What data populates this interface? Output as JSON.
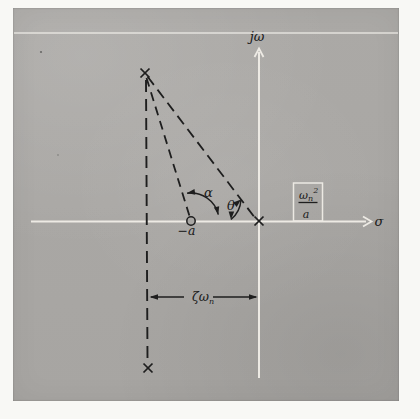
{
  "figure": {
    "kind": "s-plane pole-zero diagram (scanned textbook figure)",
    "axes": {
      "imaginary_label": "jω",
      "real_label": "σ"
    },
    "labels": {
      "alpha": "α",
      "theta": "θ",
      "zero_position": "−a",
      "damping_base": "ζω",
      "damping_sub": "n",
      "gain_num_base": "ω",
      "gain_num_sub": "n",
      "gain_num_sup": "2",
      "gain_den": "a"
    },
    "symbols": {
      "pole_marker": "×",
      "zero_marker": "○"
    },
    "colors": {
      "paper_gray": "#a9a7a4",
      "page_margin": "#f8f8f5",
      "drawn_line_white": "#edeae4",
      "ink_black": "#1e1e1e"
    }
  }
}
